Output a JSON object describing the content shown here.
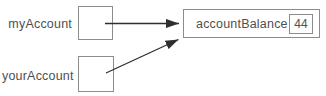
{
  "diagram": {
    "references": [
      {
        "label": "myAccount"
      },
      {
        "label": "yourAccount"
      }
    ],
    "object": {
      "label": "accountBalance",
      "value": "44"
    },
    "colors": {
      "box_border": "#8c8c8c",
      "arrow": "#2f2f2f",
      "text": "#4f4f4f",
      "background": "#ffffff"
    }
  }
}
